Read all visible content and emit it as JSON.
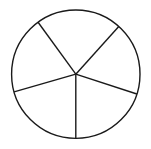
{
  "figure": {
    "kind": "geometry-diagram",
    "background_color": "#ffffff",
    "stroke_color": "#1a1a1a",
    "canvas": {
      "width": 151,
      "height": 149
    },
    "circle": {
      "name": "outer-circle",
      "cx": 75.8,
      "cy": 74.2,
      "r": 64.2,
      "stroke_width": 1.4,
      "fill": "none"
    },
    "center_point": {
      "x": 75.8,
      "y": 74.2,
      "label": ""
    },
    "radii": [
      {
        "name": "radius-upper-right",
        "angle_deg": 48,
        "endpoint": {
          "x": 118.8,
          "y": 26.5
        },
        "stroke_width": 1.4
      },
      {
        "name": "radius-upper-left",
        "angle_deg": 126,
        "endpoint": {
          "x": 38.1,
          "y": 22.3
        },
        "stroke_width": 1.4
      },
      {
        "name": "radius-left",
        "angle_deg": 196,
        "endpoint": {
          "x": 14.1,
          "y": 91.9
        },
        "stroke_width": 1.4
      },
      {
        "name": "radius-bottom",
        "angle_deg": 270,
        "endpoint": {
          "x": 75.8,
          "y": 138.4
        },
        "stroke_width": 1.4
      },
      {
        "name": "radius-right",
        "angle_deg": 342,
        "endpoint": {
          "x": 136.9,
          "y": 54.4
        },
        "stroke_width": 1.4
      }
    ],
    "sectors": [
      {
        "name": "sector-top",
        "start_angle_deg": 48,
        "end_angle_deg": 126,
        "sweep_deg": 78,
        "fill": "none"
      },
      {
        "name": "sector-upper-left",
        "start_angle_deg": 126,
        "end_angle_deg": 196,
        "sweep_deg": 70,
        "fill": "none"
      },
      {
        "name": "sector-lower-left",
        "start_angle_deg": 196,
        "end_angle_deg": 270,
        "sweep_deg": 74,
        "fill": "none"
      },
      {
        "name": "sector-lower-right",
        "start_angle_deg": 270,
        "end_angle_deg": 342,
        "sweep_deg": 72,
        "fill": "none"
      },
      {
        "name": "sector-right",
        "start_angle_deg": 342,
        "end_angle_deg": 408,
        "sweep_deg": 66,
        "fill": "none"
      }
    ],
    "sector_count": 5,
    "labels": []
  }
}
